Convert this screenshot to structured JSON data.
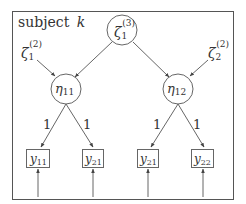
{
  "diagram": {
    "frame_label": {
      "text": "subject",
      "var": "k"
    },
    "top_latent": {
      "base": "ζ",
      "sub": "1",
      "sup": "(3)"
    },
    "disturbances": [
      {
        "base": "ζ",
        "sub": "1",
        "sup": "(2)"
      },
      {
        "base": "ζ",
        "sub": "2",
        "sup": "(2)"
      }
    ],
    "latents": [
      {
        "base": "η",
        "sub": "11"
      },
      {
        "base": "η",
        "sub": "12"
      }
    ],
    "loadings": [
      "1",
      "1",
      "1",
      "1"
    ],
    "indicators": [
      {
        "base": "y",
        "sub": "11"
      },
      {
        "base": "y",
        "sub": "21"
      },
      {
        "base": "y",
        "sub": "21"
      },
      {
        "base": "y",
        "sub": "22"
      }
    ],
    "colors": {
      "stroke": "#555555",
      "text": "#333333",
      "background": "#ffffff"
    }
  }
}
